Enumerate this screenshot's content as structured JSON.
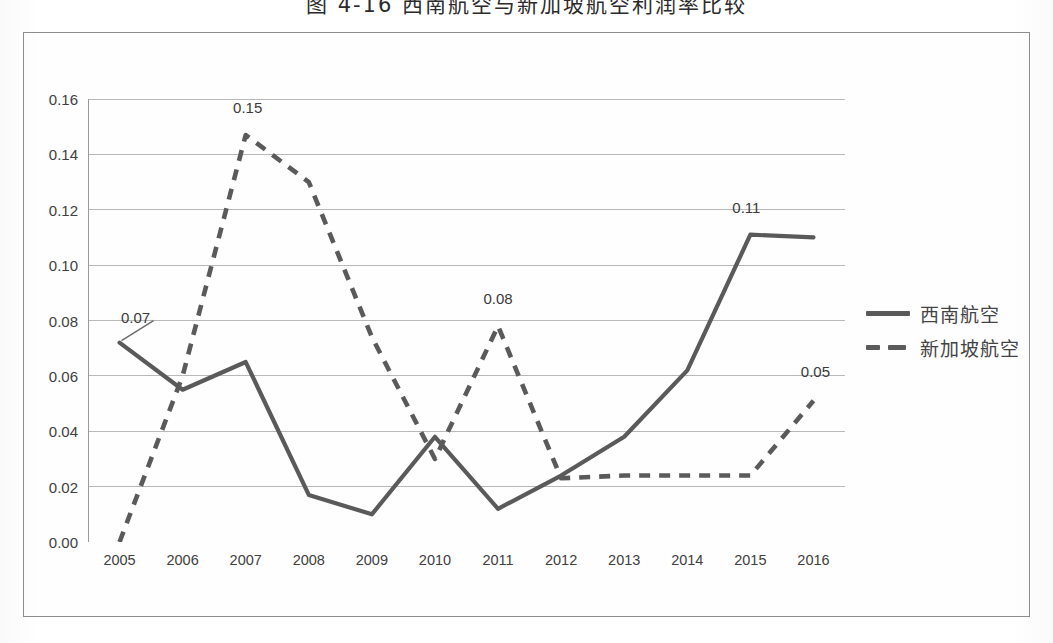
{
  "title": "图 4-16  西南航空与新加坡航空利润率比较",
  "legend": {
    "position": "right",
    "items": [
      {
        "label": "西南航空",
        "style": "solid"
      },
      {
        "label": "新加坡航空",
        "style": "dashed"
      }
    ]
  },
  "axes": {
    "y_ticks": [
      "0.00",
      "0.02",
      "0.04",
      "0.06",
      "0.08",
      "0.10",
      "0.12",
      "0.14",
      "0.16"
    ],
    "x_ticks": [
      "2005",
      "2006",
      "2007",
      "2008",
      "2009",
      "2010",
      "2011",
      "2012",
      "2013",
      "2014",
      "2015",
      "2016"
    ]
  },
  "annotations": [
    {
      "text": "0.07",
      "series": "西南航空",
      "x": "2005"
    },
    {
      "text": "0.15",
      "series": "新加坡航空",
      "x": "2007"
    },
    {
      "text": "0.08",
      "series": "新加坡航空",
      "x": "2011"
    },
    {
      "text": "0.11",
      "series": "西南航空",
      "x": "2015"
    },
    {
      "text": "0.05",
      "series": "新加坡航空",
      "x": "2016"
    }
  ],
  "colors": {
    "line": "#5a5a5a",
    "grid": "#b8b8b8",
    "frame": "#8d8d8d",
    "text": "#404040"
  },
  "chart_data": {
    "type": "line",
    "title": "图 4-16  西南航空与新加坡航空利润率比较",
    "xlabel": "",
    "ylabel": "",
    "ylim": [
      0.0,
      0.16
    ],
    "ytick_step": 0.02,
    "grid": true,
    "legend_position": "right",
    "categories": [
      "2005",
      "2006",
      "2007",
      "2008",
      "2009",
      "2010",
      "2011",
      "2012",
      "2013",
      "2014",
      "2015",
      "2016"
    ],
    "series": [
      {
        "name": "西南航空",
        "style": "solid",
        "values": [
          0.072,
          0.055,
          0.065,
          0.017,
          0.01,
          0.038,
          0.012,
          0.024,
          0.038,
          0.062,
          0.111,
          0.11
        ]
      },
      {
        "name": "新加坡航空",
        "style": "dashed",
        "values": [
          0.0,
          0.06,
          0.147,
          0.13,
          0.074,
          0.03,
          0.078,
          0.023,
          0.024,
          0.024,
          0.024,
          0.051
        ]
      }
    ],
    "data_labels": {
      "西南航空": {
        "2005": 0.07,
        "2015": 0.11
      },
      "新加坡航空": {
        "2007": 0.15,
        "2011": 0.08,
        "2016": 0.05
      }
    }
  }
}
